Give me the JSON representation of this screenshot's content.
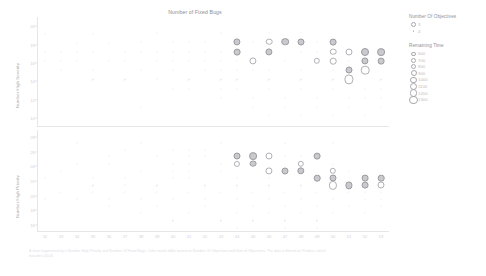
{
  "chart_data": {
    "type": "scatter",
    "title": "Number of Fixed Bugs",
    "xlabel": "",
    "panels": [
      {
        "name": "top",
        "ylabel": "Number High Severity",
        "yticks": [
          "20",
          "18",
          "16",
          "14",
          "12",
          "10"
        ],
        "ylim": [
          9,
          21
        ]
      },
      {
        "name": "bottom",
        "ylabel": "Number High Priority",
        "yticks": [
          "28",
          "26",
          "24",
          "22",
          "20",
          "18",
          "16"
        ],
        "ylim": [
          15,
          29
        ]
      }
    ],
    "xticks": [
      "32",
      "33",
      "34",
      "35",
      "36",
      "37",
      "38",
      "39",
      "40",
      "41",
      "42",
      "43",
      "44",
      "45",
      "46",
      "47",
      "48",
      "49",
      "50",
      "51",
      "52",
      "53"
    ],
    "xlim": [
      31.5,
      53.5
    ],
    "grid": false,
    "legends": [
      {
        "title": "Number Of Objectives",
        "type": "shape",
        "entries": [
          {
            "label": "3",
            "marker": "circle-outline"
          },
          {
            "label": "4",
            "marker": "dot"
          }
        ]
      },
      {
        "title": "Remaining Time",
        "type": "size",
        "entries": [
          {
            "label": "600",
            "size": 2.2
          },
          {
            "label": "700",
            "size": 2.8
          },
          {
            "label": "800",
            "size": 3.4
          },
          {
            "label": "900",
            "size": 4.0
          },
          {
            "label": "1000",
            "size": 4.6
          },
          {
            "label": "1100",
            "size": 5.2
          },
          {
            "label": "1200",
            "size": 5.8
          },
          {
            "label": "1300",
            "size": 6.4
          }
        ]
      }
    ],
    "top_points": [
      {
        "x": 32,
        "y": 19.2,
        "r": 0.55
      },
      {
        "x": 35,
        "y": 19.2,
        "r": 0.6
      },
      {
        "x": 39,
        "y": 19.3,
        "r": 0.55
      },
      {
        "x": 43,
        "y": 19.3,
        "r": 0.5
      },
      {
        "x": 46,
        "y": 19.3,
        "r": 0.55
      },
      {
        "x": 48,
        "y": 19.4,
        "r": 0.5
      },
      {
        "x": 34,
        "y": 18.2,
        "r": 0.6
      },
      {
        "x": 36,
        "y": 18.2,
        "r": 0.55
      },
      {
        "x": 38,
        "y": 18.3,
        "r": 0.6
      },
      {
        "x": 40,
        "y": 18.3,
        "r": 0.6
      },
      {
        "x": 41,
        "y": 18.3,
        "r": 0.55
      },
      {
        "x": 42,
        "y": 18.3,
        "r": 0.6
      },
      {
        "x": 44,
        "y": 18.3,
        "r": 2.6,
        "f": 1
      },
      {
        "x": 45,
        "y": 18.3,
        "r": 0.6
      },
      {
        "x": 46,
        "y": 18.3,
        "r": 2.3
      },
      {
        "x": 47,
        "y": 18.3,
        "r": 2.8,
        "f": 1
      },
      {
        "x": 48,
        "y": 18.3,
        "r": 2.5,
        "f": 1
      },
      {
        "x": 49,
        "y": 18.3,
        "r": 0.6
      },
      {
        "x": 50,
        "y": 18.3,
        "r": 2.4,
        "f": 1
      },
      {
        "x": 32,
        "y": 17.2,
        "r": 0.6
      },
      {
        "x": 33,
        "y": 17.2,
        "r": 0.55
      },
      {
        "x": 34,
        "y": 17.2,
        "r": 0.6
      },
      {
        "x": 35,
        "y": 17.2,
        "r": 0.55
      },
      {
        "x": 37,
        "y": 17.2,
        "r": 0.6
      },
      {
        "x": 38,
        "y": 17.2,
        "r": 0.55
      },
      {
        "x": 39,
        "y": 17.2,
        "r": 0.6
      },
      {
        "x": 40,
        "y": 17.2,
        "r": 0.55
      },
      {
        "x": 41,
        "y": 17.2,
        "r": 0.6
      },
      {
        "x": 42,
        "y": 17.2,
        "r": 0.6
      },
      {
        "x": 43,
        "y": 17.2,
        "r": 0.6
      },
      {
        "x": 44,
        "y": 17.2,
        "r": 2.4,
        "f": 1
      },
      {
        "x": 46,
        "y": 17.2,
        "r": 2.6,
        "f": 1
      },
      {
        "x": 48,
        "y": 17.2,
        "r": 0.6
      },
      {
        "x": 49,
        "y": 17.2,
        "r": 0.6
      },
      {
        "x": 50,
        "y": 17.2,
        "r": 2.3
      },
      {
        "x": 51,
        "y": 17.2,
        "r": 2.5
      },
      {
        "x": 52,
        "y": 17.2,
        "r": 3.0,
        "f": 1
      },
      {
        "x": 53,
        "y": 17.2,
        "r": 2.9,
        "f": 1
      },
      {
        "x": 32,
        "y": 16.2,
        "r": 0.6
      },
      {
        "x": 33,
        "y": 16.2,
        "r": 0.55
      },
      {
        "x": 34,
        "y": 16.2,
        "r": 0.6
      },
      {
        "x": 36,
        "y": 16.2,
        "r": 0.55
      },
      {
        "x": 37,
        "y": 16.2,
        "r": 0.6
      },
      {
        "x": 39,
        "y": 16.2,
        "r": 0.55
      },
      {
        "x": 40,
        "y": 16.2,
        "r": 0.6
      },
      {
        "x": 41,
        "y": 16.2,
        "r": 0.6
      },
      {
        "x": 42,
        "y": 16.2,
        "r": 0.6
      },
      {
        "x": 43,
        "y": 16.2,
        "r": 0.6
      },
      {
        "x": 44,
        "y": 16.2,
        "r": 0.6
      },
      {
        "x": 45,
        "y": 16.2,
        "r": 2.6
      },
      {
        "x": 47,
        "y": 16.2,
        "r": 0.6
      },
      {
        "x": 49,
        "y": 16.2,
        "r": 2.2
      },
      {
        "x": 50,
        "y": 16.2,
        "r": 2.3
      },
      {
        "x": 51,
        "y": 16.2,
        "r": 0.6
      },
      {
        "x": 52,
        "y": 16.2,
        "r": 2.6,
        "f": 1
      },
      {
        "x": 53,
        "y": 16.2,
        "r": 2.4,
        "f": 1
      },
      {
        "x": 33,
        "y": 15.2,
        "r": 0.55
      },
      {
        "x": 35,
        "y": 15.2,
        "r": 0.6
      },
      {
        "x": 38,
        "y": 15.2,
        "r": 0.55
      },
      {
        "x": 40,
        "y": 15.2,
        "r": 0.6
      },
      {
        "x": 42,
        "y": 15.2,
        "r": 0.55
      },
      {
        "x": 43,
        "y": 15.2,
        "r": 0.6
      },
      {
        "x": 44,
        "y": 15.2,
        "r": 0.6
      },
      {
        "x": 45,
        "y": 15.2,
        "r": 0.6
      },
      {
        "x": 46,
        "y": 15.2,
        "r": 0.6
      },
      {
        "x": 48,
        "y": 15.2,
        "r": 0.6
      },
      {
        "x": 50,
        "y": 15.2,
        "r": 0.6
      },
      {
        "x": 51,
        "y": 15.2,
        "r": 2.5,
        "f": 1
      },
      {
        "x": 52,
        "y": 15.2,
        "r": 3.3
      },
      {
        "x": 35,
        "y": 14.2,
        "r": 0.6
      },
      {
        "x": 37,
        "y": 14.2,
        "r": 0.6
      },
      {
        "x": 39,
        "y": 14.2,
        "r": 0.55
      },
      {
        "x": 41,
        "y": 14.2,
        "r": 0.6
      },
      {
        "x": 43,
        "y": 14.2,
        "r": 0.6
      },
      {
        "x": 44,
        "y": 14.2,
        "r": 0.6
      },
      {
        "x": 46,
        "y": 14.2,
        "r": 0.6
      },
      {
        "x": 48,
        "y": 14.2,
        "r": 0.6
      },
      {
        "x": 50,
        "y": 14.2,
        "r": 0.6
      },
      {
        "x": 51,
        "y": 14.2,
        "r": 3.6
      },
      {
        "x": 53,
        "y": 14.2,
        "r": 0.6
      },
      {
        "x": 40,
        "y": 13.2,
        "r": 0.6
      },
      {
        "x": 41,
        "y": 13.2,
        "r": 0.55
      },
      {
        "x": 43,
        "y": 13.2,
        "r": 0.6
      },
      {
        "x": 44,
        "y": 13.2,
        "r": 0.6
      },
      {
        "x": 46,
        "y": 13.2,
        "r": 0.6
      },
      {
        "x": 48,
        "y": 13.2,
        "r": 0.6
      },
      {
        "x": 50,
        "y": 13.2,
        "r": 0.6
      },
      {
        "x": 52,
        "y": 13.2,
        "r": 0.6
      },
      {
        "x": 53,
        "y": 13.2,
        "r": 0.6
      },
      {
        "x": 43,
        "y": 12.2,
        "r": 0.6
      },
      {
        "x": 45,
        "y": 12.2,
        "r": 0.6
      },
      {
        "x": 47,
        "y": 12.2,
        "r": 0.6
      },
      {
        "x": 49,
        "y": 12.2,
        "r": 0.6
      },
      {
        "x": 51,
        "y": 12.2,
        "r": 0.6
      },
      {
        "x": 52,
        "y": 12.2,
        "r": 0.6
      },
      {
        "x": 53,
        "y": 12.2,
        "r": 0.6
      },
      {
        "x": 38,
        "y": 11.2,
        "r": 0.6
      },
      {
        "x": 45,
        "y": 11.2,
        "r": 0.6
      },
      {
        "x": 47,
        "y": 11.2,
        "r": 0.6
      },
      {
        "x": 49,
        "y": 11.2,
        "r": 0.6
      },
      {
        "x": 51,
        "y": 11.2,
        "r": 0.6
      },
      {
        "x": 53,
        "y": 11.2,
        "r": 0.6
      },
      {
        "x": 46,
        "y": 10.3,
        "r": 0.6
      },
      {
        "x": 48,
        "y": 10.3,
        "r": 0.6
      },
      {
        "x": 50,
        "y": 10.3,
        "r": 0.6
      },
      {
        "x": 52,
        "y": 10.3,
        "r": 0.6
      }
    ],
    "bottom_points": [
      {
        "x": 34,
        "y": 27.2,
        "r": 0.55
      },
      {
        "x": 38,
        "y": 27.2,
        "r": 0.6
      },
      {
        "x": 43,
        "y": 27.2,
        "r": 0.55
      },
      {
        "x": 47,
        "y": 27.2,
        "r": 0.5
      },
      {
        "x": 50,
        "y": 27.2,
        "r": 0.55
      },
      {
        "x": 37,
        "y": 26.3,
        "r": 0.6
      },
      {
        "x": 40,
        "y": 26.3,
        "r": 0.55
      },
      {
        "x": 41,
        "y": 26.3,
        "r": 0.6
      },
      {
        "x": 42,
        "y": 26.3,
        "r": 0.55
      },
      {
        "x": 36,
        "y": 25.4,
        "r": 0.6
      },
      {
        "x": 39,
        "y": 25.4,
        "r": 0.55
      },
      {
        "x": 41,
        "y": 25.4,
        "r": 0.6
      },
      {
        "x": 42,
        "y": 25.4,
        "r": 0.6
      },
      {
        "x": 44,
        "y": 25.4,
        "r": 2.5,
        "f": 1
      },
      {
        "x": 45,
        "y": 25.4,
        "r": 2.9,
        "f": 1
      },
      {
        "x": 46,
        "y": 25.4,
        "r": 2.5
      },
      {
        "x": 47,
        "y": 25.4,
        "r": 0.6
      },
      {
        "x": 48,
        "y": 25.4,
        "r": 0.6
      },
      {
        "x": 49,
        "y": 25.4,
        "r": 2.4,
        "f": 1
      },
      {
        "x": 34,
        "y": 24.4,
        "r": 0.55
      },
      {
        "x": 36,
        "y": 24.4,
        "r": 0.6
      },
      {
        "x": 40,
        "y": 24.4,
        "r": 0.6
      },
      {
        "x": 41,
        "y": 24.4,
        "r": 0.55
      },
      {
        "x": 43,
        "y": 24.4,
        "r": 0.6
      },
      {
        "x": 44,
        "y": 24.4,
        "r": 2.1
      },
      {
        "x": 45,
        "y": 24.4,
        "r": 2.4,
        "f": 1
      },
      {
        "x": 48,
        "y": 24.4,
        "r": 2.2
      },
      {
        "x": 50,
        "y": 24.4,
        "r": 0.6
      },
      {
        "x": 33,
        "y": 23.4,
        "r": 0.6
      },
      {
        "x": 38,
        "y": 23.4,
        "r": 0.55
      },
      {
        "x": 40,
        "y": 23.4,
        "r": 0.6
      },
      {
        "x": 41,
        "y": 23.4,
        "r": 0.6
      },
      {
        "x": 43,
        "y": 23.4,
        "r": 0.55
      },
      {
        "x": 46,
        "y": 23.4,
        "r": 2.6
      },
      {
        "x": 47,
        "y": 23.4,
        "r": 2.5,
        "f": 1
      },
      {
        "x": 48,
        "y": 23.4,
        "r": 2.7,
        "f": 1
      },
      {
        "x": 50,
        "y": 23.4,
        "r": 2.2
      },
      {
        "x": 51,
        "y": 23.4,
        "r": 0.6
      },
      {
        "x": 32,
        "y": 22.4,
        "r": 0.55
      },
      {
        "x": 35,
        "y": 22.4,
        "r": 0.6
      },
      {
        "x": 37,
        "y": 22.4,
        "r": 0.55
      },
      {
        "x": 40,
        "y": 22.4,
        "r": 0.6
      },
      {
        "x": 41,
        "y": 22.4,
        "r": 0.6
      },
      {
        "x": 44,
        "y": 22.4,
        "r": 0.55
      },
      {
        "x": 46,
        "y": 22.4,
        "r": 0.6
      },
      {
        "x": 49,
        "y": 22.4,
        "r": 2.3,
        "f": 1
      },
      {
        "x": 50,
        "y": 22.4,
        "r": 2.5,
        "f": 1
      },
      {
        "x": 52,
        "y": 22.4,
        "r": 2.4,
        "f": 1
      },
      {
        "x": 53,
        "y": 22.4,
        "r": 2.3,
        "f": 1
      },
      {
        "x": 35,
        "y": 21.4,
        "r": 0.6
      },
      {
        "x": 37,
        "y": 21.4,
        "r": 0.55
      },
      {
        "x": 39,
        "y": 21.4,
        "r": 0.6
      },
      {
        "x": 42,
        "y": 21.4,
        "r": 0.6
      },
      {
        "x": 44,
        "y": 21.4,
        "r": 0.6
      },
      {
        "x": 46,
        "y": 21.4,
        "r": 0.6
      },
      {
        "x": 48,
        "y": 21.4,
        "r": 0.6
      },
      {
        "x": 50,
        "y": 21.4,
        "r": 3.1
      },
      {
        "x": 51,
        "y": 21.4,
        "r": 2.6,
        "f": 1
      },
      {
        "x": 52,
        "y": 21.4,
        "r": 2.4,
        "f": 1
      },
      {
        "x": 53,
        "y": 21.4,
        "r": 2.5
      },
      {
        "x": 33,
        "y": 20.5,
        "r": 0.6
      },
      {
        "x": 35,
        "y": 20.5,
        "r": 0.55
      },
      {
        "x": 37,
        "y": 20.5,
        "r": 0.6
      },
      {
        "x": 39,
        "y": 20.5,
        "r": 0.6
      },
      {
        "x": 41,
        "y": 20.5,
        "r": 0.6
      },
      {
        "x": 43,
        "y": 20.5,
        "r": 0.6
      },
      {
        "x": 45,
        "y": 20.5,
        "r": 0.6
      },
      {
        "x": 47,
        "y": 20.5,
        "r": 0.6
      },
      {
        "x": 49,
        "y": 20.5,
        "r": 0.6
      },
      {
        "x": 51,
        "y": 20.5,
        "r": 0.6
      },
      {
        "x": 52,
        "y": 20.5,
        "r": 0.6
      },
      {
        "x": 53,
        "y": 20.5,
        "r": 0.6
      },
      {
        "x": 32,
        "y": 19.5,
        "r": 0.6
      },
      {
        "x": 34,
        "y": 19.5,
        "r": 0.55
      },
      {
        "x": 36,
        "y": 19.5,
        "r": 0.6
      },
      {
        "x": 38,
        "y": 19.5,
        "r": 0.6
      },
      {
        "x": 40,
        "y": 19.5,
        "r": 0.6
      },
      {
        "x": 42,
        "y": 19.5,
        "r": 0.6
      },
      {
        "x": 44,
        "y": 19.5,
        "r": 0.6
      },
      {
        "x": 46,
        "y": 19.5,
        "r": 0.6
      },
      {
        "x": 48,
        "y": 19.5,
        "r": 0.6
      },
      {
        "x": 50,
        "y": 19.5,
        "r": 0.6
      },
      {
        "x": 52,
        "y": 19.5,
        "r": 0.6
      },
      {
        "x": 53,
        "y": 19.5,
        "r": 0.6
      },
      {
        "x": 36,
        "y": 18.6,
        "r": 0.6
      },
      {
        "x": 39,
        "y": 18.6,
        "r": 0.6
      },
      {
        "x": 42,
        "y": 18.6,
        "r": 0.6
      },
      {
        "x": 45,
        "y": 18.6,
        "r": 0.6
      },
      {
        "x": 47,
        "y": 18.6,
        "r": 0.6
      },
      {
        "x": 49,
        "y": 18.6,
        "r": 0.6
      },
      {
        "x": 51,
        "y": 18.6,
        "r": 0.6
      },
      {
        "x": 53,
        "y": 18.6,
        "r": 0.6
      },
      {
        "x": 38,
        "y": 17.6,
        "r": 0.6
      },
      {
        "x": 41,
        "y": 17.6,
        "r": 0.6
      },
      {
        "x": 44,
        "y": 17.6,
        "r": 0.6
      },
      {
        "x": 46,
        "y": 17.6,
        "r": 0.6
      },
      {
        "x": 48,
        "y": 17.6,
        "r": 0.6
      },
      {
        "x": 50,
        "y": 17.6,
        "r": 0.6
      },
      {
        "x": 52,
        "y": 17.6,
        "r": 0.6
      },
      {
        "x": 40,
        "y": 16.6,
        "r": 0.6
      },
      {
        "x": 43,
        "y": 16.6,
        "r": 0.6
      },
      {
        "x": 45,
        "y": 16.6,
        "r": 0.6
      },
      {
        "x": 47,
        "y": 16.6,
        "r": 0.6
      },
      {
        "x": 49,
        "y": 16.6,
        "r": 0.6
      },
      {
        "x": 44,
        "y": 15.6,
        "r": 0.6
      },
      {
        "x": 47,
        "y": 15.6,
        "r": 0.6
      },
      {
        "x": 49,
        "y": 15.6,
        "r": 0.6
      }
    ]
  },
  "caption": "A chart segmented by a Number High Priority and Number Of Fixed Bugs. Color marks differ based on Number Of Objectives and Size of Objectives. The data is filtered on Product, which includes 045,B."
}
